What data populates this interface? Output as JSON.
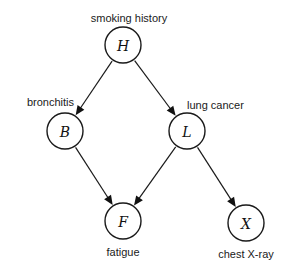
{
  "diagram": {
    "type": "bayesian-network",
    "background_color": "#ffffff",
    "stroke_color": "#1a1a1a",
    "node_fill_color": "#ffffff",
    "width": 296,
    "height": 272,
    "node_radius": 18,
    "nodes": [
      {
        "id": "H",
        "letter": "H",
        "label": "smoking history",
        "label_position": "above",
        "cx": 123,
        "cy": 45,
        "label_x": 129,
        "label_y": 22
      },
      {
        "id": "B",
        "letter": "B",
        "label": "bronchitis",
        "label_position": "above-left",
        "cx": 65,
        "cy": 131,
        "label_x": 74,
        "label_y": 106
      },
      {
        "id": "L",
        "letter": "L",
        "label": "lung cancer",
        "label_position": "above-right",
        "cx": 187,
        "cy": 131,
        "label_x": 187,
        "label_y": 109
      },
      {
        "id": "F",
        "letter": "F",
        "label": "fatigue",
        "label_position": "below",
        "cx": 123,
        "cy": 221,
        "label_x": 123,
        "label_y": 256
      },
      {
        "id": "X",
        "letter": "X",
        "label": "chest X-ray",
        "label_position": "below",
        "cx": 246,
        "cy": 223,
        "label_x": 246,
        "label_y": 258
      }
    ],
    "edges": [
      {
        "id": "H-B",
        "from": "H",
        "to": "B",
        "directed": true
      },
      {
        "id": "H-L",
        "from": "H",
        "to": "L",
        "directed": true
      },
      {
        "id": "B-F",
        "from": "B",
        "to": "F",
        "directed": true
      },
      {
        "id": "L-F",
        "from": "L",
        "to": "F",
        "directed": true
      },
      {
        "id": "L-X",
        "from": "L",
        "to": "X",
        "directed": true
      }
    ]
  }
}
